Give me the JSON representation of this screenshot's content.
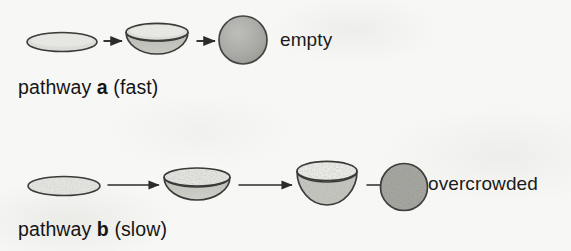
{
  "figure": {
    "background_color": "#f7f7f5",
    "ink_color": "#2b2b2b"
  },
  "pathways": [
    {
      "id": "a",
      "caption_prefix": "pathway ",
      "caption_letter": "a",
      "caption_suffix": " (fast)",
      "outcome_label": "empty",
      "speed": "fast",
      "stages": [
        {
          "name": "flat-disc",
          "shape": "flat-ellipse",
          "stippled": false,
          "fill": "#dcdcd8"
        },
        {
          "name": "shallow-bowl",
          "shape": "shallow-bowl",
          "stippled": false,
          "fill": "#d8d8d4"
        },
        {
          "name": "closed-sphere",
          "shape": "sphere",
          "stippled": false,
          "fill": "#a8a8a4"
        }
      ],
      "arrow_count": 2,
      "arrow_style": "short"
    },
    {
      "id": "b",
      "caption_prefix": "pathway ",
      "caption_letter": "b",
      "caption_suffix": " (slow)",
      "outcome_label": "overcrowded",
      "speed": "slow",
      "stages": [
        {
          "name": "flat-disc",
          "shape": "flat-ellipse",
          "stippled": true,
          "fill": "#e2e2de"
        },
        {
          "name": "shallow-bowl",
          "shape": "shallow-bowl",
          "stippled": true,
          "fill": "#e0e0dc"
        },
        {
          "name": "deep-bowl",
          "shape": "deep-bowl",
          "stippled": true,
          "fill": "#c8c8c2"
        },
        {
          "name": "closed-sphere",
          "shape": "sphere",
          "stippled": true,
          "fill": "#9c9c96"
        }
      ],
      "arrow_count": 3,
      "arrow_style": "long"
    }
  ]
}
